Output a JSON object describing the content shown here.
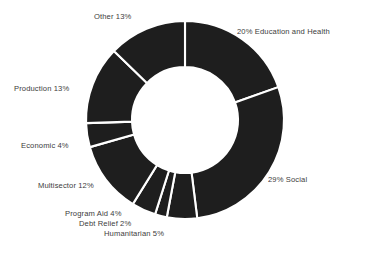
{
  "figure": {
    "background_color": "#ffffff",
    "slice_color": "#1e1e1e",
    "separator_color": "#ffffff",
    "label_color": "#3c3c3c"
  },
  "chart_data": {
    "type": "pie",
    "variant": "donut",
    "title": "",
    "subtitle": "",
    "xlabel": "",
    "ylabel": "",
    "grid": false,
    "legend_position": "none",
    "labels_position": "outside-callout",
    "start_angle_deg": 0,
    "direction": "clockwise",
    "units": "percent",
    "center": {
      "x": 185,
      "y": 120
    },
    "outer_radius": 99,
    "inner_radius": 53,
    "categories": [
      "Education and Health",
      "Social",
      "Humanitarian",
      "Debt Relief",
      "Program Aid",
      "Multisector",
      "Economic",
      "Production",
      "Other"
    ],
    "values": [
      20,
      29,
      5,
      2,
      4,
      12,
      4,
      13,
      13
    ],
    "total": 102,
    "slices": [
      {
        "name": "Education and Health",
        "value": 20,
        "label": "20% Education and Health",
        "color": "#1e1e1e",
        "start_deg": 0,
        "end_deg": 70.6
      },
      {
        "name": "Social",
        "value": 29,
        "label": "29% Social",
        "color": "#1e1e1e",
        "start_deg": 70.6,
        "end_deg": 172.9
      },
      {
        "name": "Humanitarian",
        "value": 5,
        "label": "Humanitarian 5%",
        "color": "#1e1e1e",
        "start_deg": 172.9,
        "end_deg": 190.6
      },
      {
        "name": "Debt Relief",
        "value": 2,
        "label": "Debt Relief 2%",
        "color": "#1e1e1e",
        "start_deg": 190.6,
        "end_deg": 197.6
      },
      {
        "name": "Program Aid",
        "value": 4,
        "label": "Program Aid 4%",
        "color": "#1e1e1e",
        "start_deg": 197.6,
        "end_deg": 211.8
      },
      {
        "name": "Multisector",
        "value": 12,
        "label": "Multisector 12%",
        "color": "#1e1e1e",
        "start_deg": 211.8,
        "end_deg": 254.1
      },
      {
        "name": "Economic",
        "value": 4,
        "label": "Economic 4%",
        "color": "#1e1e1e",
        "start_deg": 254.1,
        "end_deg": 268.2
      },
      {
        "name": "Production",
        "value": 13,
        "label": "Production 13%",
        "color": "#1e1e1e",
        "start_deg": 268.2,
        "end_deg": 314.1
      },
      {
        "name": "Other",
        "value": 13,
        "label": "Other 13%",
        "color": "#1e1e1e",
        "start_deg": 314.1,
        "end_deg": 360
      }
    ]
  },
  "labels": {
    "education_and_health": "20% Education and Health",
    "social": "29% Social",
    "other": "Other 13%",
    "production": "Production 13%",
    "economic": "Economic 4%",
    "multisector": "Multisector 12%",
    "program_aid": "Program Aid 4%",
    "debt_relief": "Debt Relief 2%",
    "humanitarian": "Humanitarian 5%"
  }
}
